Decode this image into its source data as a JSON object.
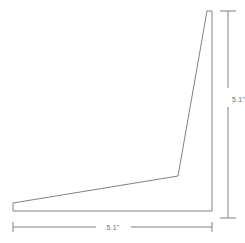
{
  "drawing": {
    "title": "Angle bracket profile with dimensions",
    "background_color": "#ffffff",
    "line_color": "#808080",
    "text_color": "#6e6e6e",
    "line_width": 1,
    "part_outline": {
      "name": "angle-bracket-outline",
      "shape": "L-shaped tapered angle bracket",
      "points": "13,203 178,176 207,11 212,11 212,211 13,211",
      "vertices": [
        {
          "label": "left-tip-top",
          "x": 13,
          "y": 203
        },
        {
          "label": "inner-corner",
          "x": 178,
          "y": 176
        },
        {
          "label": "top-inner",
          "x": 207,
          "y": 11
        },
        {
          "label": "top-outer",
          "x": 212,
          "y": 11
        },
        {
          "label": "bottom-right",
          "x": 212,
          "y": 211
        },
        {
          "label": "bottom-left",
          "x": 13,
          "y": 211
        }
      ]
    },
    "dimensions": [
      {
        "name": "horizontal-dimension",
        "label": "5.1\"",
        "orientation": "horizontal",
        "value": 5.1,
        "unit": "inch",
        "line_y": 227,
        "start_x": 13,
        "end_x": 212,
        "text_x": 113,
        "text_y": 230,
        "gap_start_x": 96,
        "gap_end_x": 131,
        "tick_half_height": 5
      },
      {
        "name": "vertical-dimension",
        "label": "5.1\"",
        "orientation": "vertical",
        "value": 5.1,
        "unit": "inch",
        "line_x": 228,
        "start_y": 11,
        "end_y": 218,
        "text_x": 232,
        "text_y": 102,
        "gap_start_y": 88,
        "gap_end_y": 107,
        "tick_half_width": 8
      }
    ]
  }
}
